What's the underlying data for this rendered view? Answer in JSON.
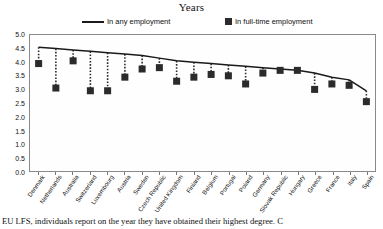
{
  "chart_data": {
    "type": "line",
    "title": "Years",
    "xlabel": "",
    "ylabel": "",
    "ylim": [
      0.0,
      5.0
    ],
    "ystep": 0.5,
    "grid": false,
    "legend_position": "top",
    "ytick_labels": [
      "5.0",
      "4.5",
      "4.0",
      "3.5",
      "3.0",
      "2.5",
      "2.0",
      "1.5",
      "1.0",
      "0.5",
      "0.0"
    ],
    "categories": [
      "Denmark",
      "Netherlands",
      "Australia",
      "Switzerland",
      "Luxembourg",
      "Austria",
      "Sweden",
      "Czech Republic",
      "United Kingdom",
      "Finland",
      "Belgium",
      "Portugal",
      "Poland",
      "Germany",
      "Slovak Republic",
      "Hungary",
      "Greece",
      "France",
      "Italy",
      "Spain"
    ],
    "series": [
      {
        "name": "In any employment",
        "marker": "line",
        "values": [
          4.55,
          4.5,
          4.45,
          4.4,
          4.35,
          4.3,
          4.25,
          4.15,
          4.05,
          4.0,
          3.95,
          3.9,
          3.85,
          3.8,
          3.75,
          3.7,
          3.6,
          3.45,
          3.35,
          2.95
        ]
      },
      {
        "name": "In full-time employment",
        "marker": "square",
        "values": [
          3.95,
          3.05,
          4.05,
          2.95,
          2.95,
          3.45,
          3.75,
          3.8,
          3.3,
          3.45,
          3.55,
          3.5,
          3.2,
          3.6,
          3.7,
          3.7,
          3.0,
          3.2,
          3.15,
          2.55
        ]
      }
    ]
  },
  "legend": {
    "items": [
      {
        "label": "In any employment",
        "marker": "line"
      },
      {
        "label": "In full-time employment",
        "marker": "square"
      }
    ]
  },
  "caption": {
    "text": "EU LFS, individuals report on the year they have obtained their highest degree. C"
  },
  "colors": {
    "line": "#1a1a1a",
    "marker": "#2b2b2b",
    "frame": "#8a8a8a",
    "background": "#ffffff"
  }
}
